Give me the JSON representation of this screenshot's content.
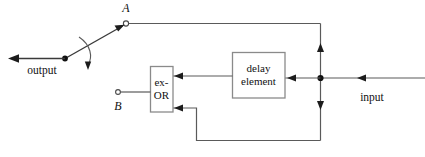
{
  "diagram": {
    "colors": {
      "wire": "#5a5a5a",
      "wire_dark": "#3a3a3a",
      "box_border": "#8a8a8a",
      "arrow": "#1c1c1c",
      "background": "#ffffff",
      "text": "#111111"
    },
    "labels": {
      "node_a": "A",
      "node_b": "B",
      "output": "output",
      "input": "input"
    },
    "blocks": [
      {
        "id": "ex-or",
        "line1": "ex-",
        "line2": "OR"
      },
      {
        "id": "delay",
        "line1": "delay",
        "line2": "element"
      }
    ]
  }
}
